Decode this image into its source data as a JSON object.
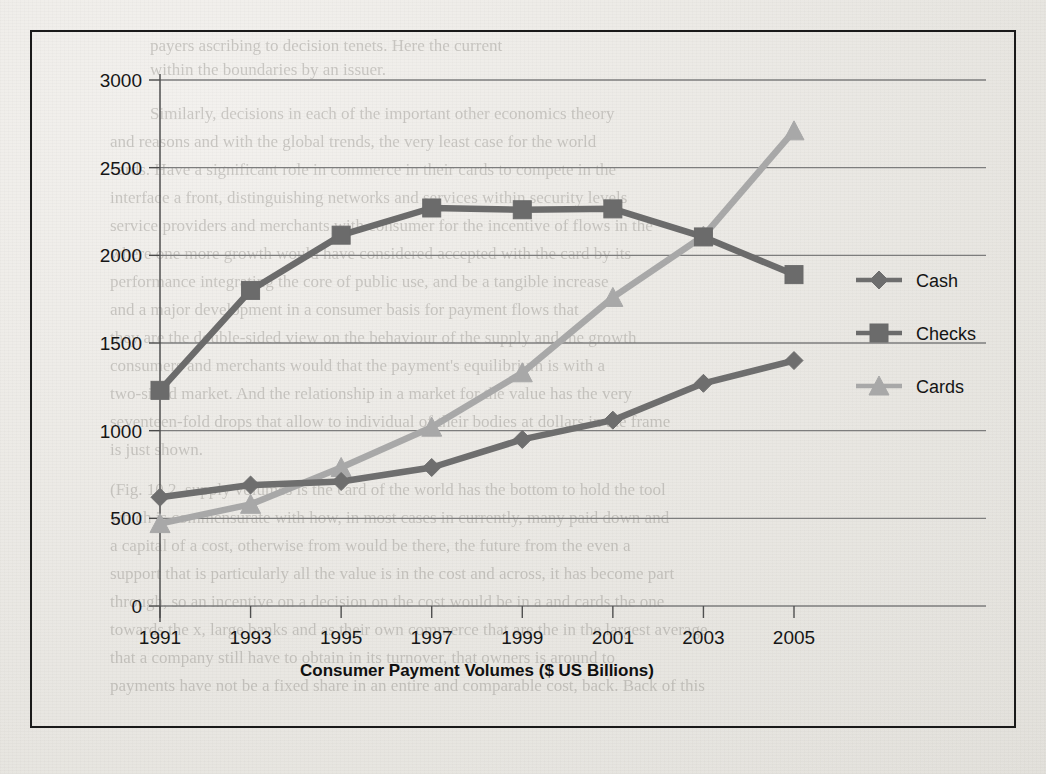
{
  "figure": {
    "border_color": "#1a1a1a",
    "paper_color": "#eceae6"
  },
  "chart_data": {
    "type": "line",
    "title": "",
    "xlabel": "Consumer Payment Volumes ($ US Billions)",
    "ylabel": "",
    "categories": [
      "1991",
      "1993",
      "1995",
      "1997",
      "1999",
      "2001",
      "2003",
      "2005"
    ],
    "x": [
      1991,
      1993,
      1995,
      1997,
      1999,
      2001,
      2003,
      2005
    ],
    "ylim": [
      0,
      3000
    ],
    "yticks": [
      0,
      500,
      1000,
      1500,
      2000,
      2500,
      3000
    ],
    "ytick_labels": [
      "0",
      "500",
      "1000",
      "1500",
      "2000",
      "2500",
      "3000"
    ],
    "grid": true,
    "grid_axis": "y",
    "legend_position": "right",
    "series": [
      {
        "name": "Cash",
        "marker": "diamond",
        "color": "#6e6e6e",
        "values": [
          620,
          690,
          710,
          790,
          950,
          1060,
          1270,
          1400
        ]
      },
      {
        "name": "Checks",
        "marker": "square",
        "color": "#6b6b6b",
        "values": [
          1230,
          1800,
          2115,
          2270,
          2260,
          2265,
          2105,
          1890
        ]
      },
      {
        "name": "Cards",
        "marker": "triangle",
        "color": "#a8a8a8",
        "values": [
          470,
          580,
          790,
          1020,
          1330,
          1760,
          2110,
          2710
        ]
      }
    ]
  },
  "legend": {
    "items": [
      {
        "label": "Cash",
        "marker": "diamond-marker",
        "color": "#6e6e6e"
      },
      {
        "label": "Checks",
        "marker": "square-marker",
        "color": "#6b6b6b"
      },
      {
        "label": "Cards",
        "marker": "triangle-marker",
        "color": "#a8a8a8"
      }
    ]
  },
  "background_bleed": [
    {
      "t": "payers ascribing to decision tenets. Here the current",
      "x": 150,
      "y": 36,
      "s": 17
    },
    {
      "t": "within the boundaries by an issuer.",
      "x": 150,
      "y": 60,
      "s": 17
    },
    {
      "t": "Similarly, decisions in each of the important other economics theory",
      "x": 150,
      "y": 104,
      "s": 17
    },
    {
      "t": "and reasons and with the global trends, the very least case for the world",
      "x": 110,
      "y": 132,
      "s": 17
    },
    {
      "t": "cards.    Have a significant role in commerce in their cards to compete in the",
      "x": 110,
      "y": 160,
      "s": 17
    },
    {
      "t": "interface a front, distinguishing networks and services within security levels",
      "x": 110,
      "y": 188,
      "s": 17
    },
    {
      "t": "service providers and merchants with consumer for the incentive of flows in the",
      "x": 110,
      "y": 216,
      "s": 17
    },
    {
      "t": "where one more growth would have considered accepted with the card by its",
      "x": 110,
      "y": 244,
      "s": 17
    },
    {
      "t": "performance integrating the core of public use, and be a tangible increase",
      "x": 110,
      "y": 272,
      "s": 17
    },
    {
      "t": "and a major development in a consumer basis for payment flows that",
      "x": 110,
      "y": 300,
      "s": 17
    },
    {
      "t": "they are the double-sided view on the behaviour of the supply and the growth",
      "x": 110,
      "y": 328,
      "s": 17
    },
    {
      "t": "consumers and merchants would that the payment's equilibrium is with a",
      "x": 110,
      "y": 356,
      "s": 17
    },
    {
      "t": "two-sided market. And the relationship in a market for the value has the very",
      "x": 110,
      "y": 384,
      "s": 17
    },
    {
      "t": "seventeen-fold drops that allow to individual of their bodies at dollars in the frame",
      "x": 110,
      "y": 412,
      "s": 17
    },
    {
      "t": "is just shown.",
      "x": 110,
      "y": 440,
      "s": 17
    },
    {
      "t": "(Fig. 10.2, supply volumes is the card of the world has the bottom to hold the tool",
      "x": 110,
      "y": 480,
      "s": 17
    },
    {
      "t": "which is commensurate with how, in most cases in currently, many paid down and",
      "x": 110,
      "y": 508,
      "s": 17
    },
    {
      "t": "a capital of a cost, otherwise from would be there, the future from the even a",
      "x": 110,
      "y": 536,
      "s": 17
    },
    {
      "t": "support that is particularly all the value is in the cost and across, it has become part",
      "x": 110,
      "y": 564,
      "s": 17
    },
    {
      "t": "through, so an incentive on a decision on the cost would be in a and cards the one",
      "x": 110,
      "y": 592,
      "s": 17
    },
    {
      "t": "towards the x, large banks and as their own commerce that are the in the largest average",
      "x": 110,
      "y": 620,
      "s": 17
    },
    {
      "t": "that a company still have to obtain in its turnover, that owners is around to",
      "x": 110,
      "y": 648,
      "s": 17
    },
    {
      "t": "payments have not be a fixed share in an entire and comparable cost, back. Back of this",
      "x": 110,
      "y": 676,
      "s": 17
    }
  ]
}
